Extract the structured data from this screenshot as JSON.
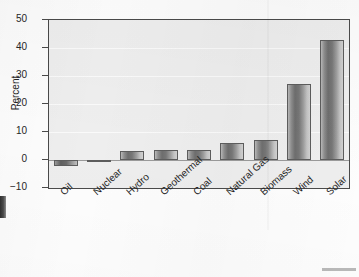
{
  "chart_data": {
    "type": "bar",
    "title": "",
    "xlabel": "",
    "ylabel": "Percent",
    "categories": [
      "Oil",
      "Nuclear",
      "Hydro",
      "Geothermal",
      "Coal",
      "Natural Gas",
      "Biomass",
      "Wind",
      "Solar"
    ],
    "values": [
      -2,
      -0.2,
      3.3,
      3.4,
      3.4,
      6.2,
      7.2,
      27,
      43
    ],
    "ylim": [
      -10,
      50
    ],
    "yticks": [
      50,
      40,
      30,
      20,
      10,
      0,
      -10
    ],
    "ytick_labels": [
      "50",
      "40",
      "30",
      "20",
      "10",
      "0",
      "−10"
    ],
    "grid": true,
    "legend": "none",
    "series": [
      {
        "name": "Percent",
        "values": [
          -2,
          -0.2,
          3.3,
          3.4,
          3.4,
          6.2,
          7.2,
          27,
          43
        ]
      }
    ],
    "colors": {
      "bar_fill": "#8f8f8f",
      "bar_edge": "#5d5d5d",
      "plot_background": "#eeeeee",
      "axis": "#4a4a4a",
      "text": "#262626"
    }
  },
  "axis": {
    "y_title": "Percent",
    "ticks": [
      {
        "label": "50",
        "value": 50
      },
      {
        "label": "40",
        "value": 40
      },
      {
        "label": "30",
        "value": 30
      },
      {
        "label": "20",
        "value": 20
      },
      {
        "label": "10",
        "value": 10
      },
      {
        "label": "0",
        "value": 0
      },
      {
        "label": "−10",
        "value": -10
      }
    ]
  },
  "bars": [
    {
      "label": "Oil",
      "value": -2
    },
    {
      "label": "Nuclear",
      "value": -0.2
    },
    {
      "label": "Hydro",
      "value": 3.3
    },
    {
      "label": "Geothermal",
      "value": 3.4
    },
    {
      "label": "Coal",
      "value": 3.4
    },
    {
      "label": "Natural Gas",
      "value": 6.2
    },
    {
      "label": "Biomass",
      "value": 7.2
    },
    {
      "label": "Wind",
      "value": 27
    },
    {
      "label": "Solar",
      "value": 43
    }
  ]
}
